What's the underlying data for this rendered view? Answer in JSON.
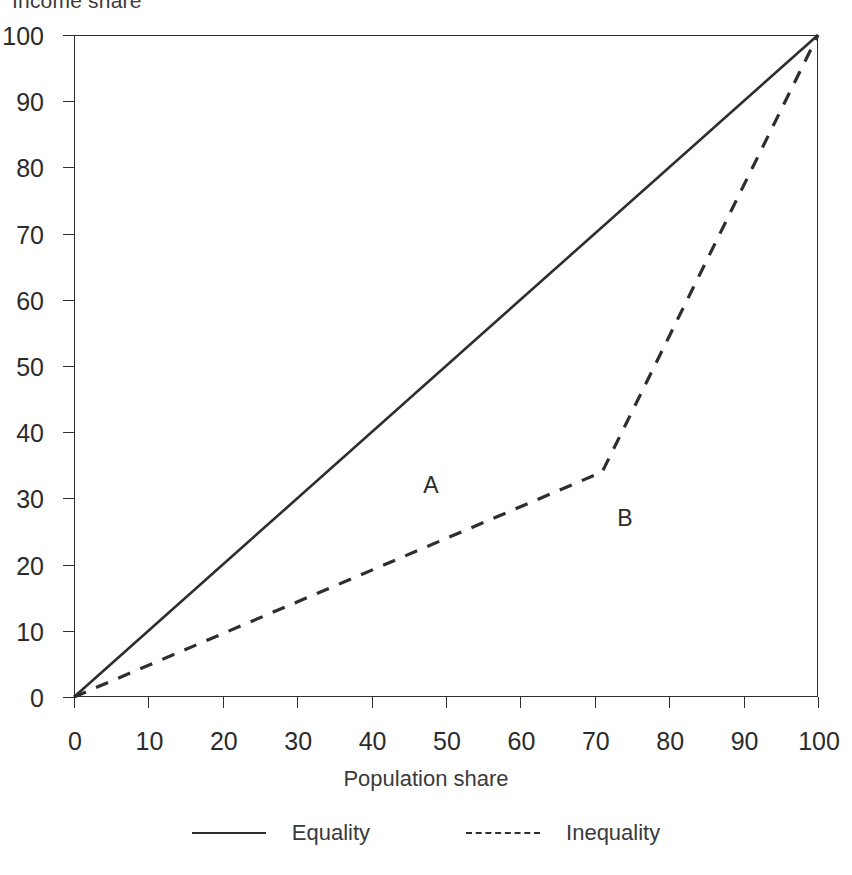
{
  "chart_data": {
    "type": "line",
    "title": "",
    "xlabel": "Population share",
    "ylabel": "Income share",
    "xlim": [
      0,
      100
    ],
    "ylim": [
      0,
      100
    ],
    "xticks": [
      0,
      10,
      20,
      30,
      40,
      50,
      60,
      70,
      80,
      90,
      100
    ],
    "yticks": [
      0,
      10,
      20,
      30,
      40,
      50,
      60,
      70,
      80,
      90,
      100
    ],
    "xticklabels": [
      "0",
      "10",
      "20",
      "30",
      "40",
      "50",
      "60",
      "70",
      "80",
      "90",
      "100"
    ],
    "yticklabels": [
      "0",
      "10",
      "20",
      "30",
      "40",
      "50",
      "60",
      "70",
      "80",
      "90",
      "100"
    ],
    "grid": false,
    "legend_position": "below",
    "series": [
      {
        "name": "Equality",
        "style": "solid",
        "color": "#2e2e2e",
        "x": [
          0,
          100
        ],
        "y": [
          0,
          100
        ]
      },
      {
        "name": "Inequality",
        "style": "dashed",
        "color": "#2e2e2e",
        "x": [
          0,
          71,
          100
        ],
        "y": [
          0,
          34,
          100
        ]
      }
    ],
    "annotations": [
      {
        "text": "A",
        "x": 48,
        "y": 32
      },
      {
        "text": "B",
        "x": 74,
        "y": 27
      }
    ]
  },
  "axis": {
    "ylabel": "Income share",
    "xlabel": "Population share"
  },
  "legend": {
    "items": [
      {
        "label": "Equality",
        "style": "solid"
      },
      {
        "label": "Inequality",
        "style": "dashed"
      }
    ]
  }
}
